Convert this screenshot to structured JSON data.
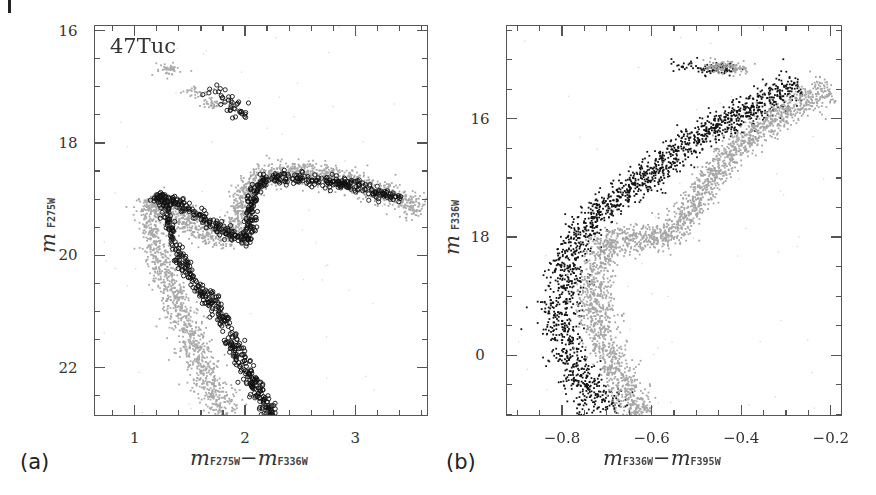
{
  "figure": {
    "panels": [
      {
        "letter": "(a)"
      },
      {
        "letter": "(b)"
      }
    ]
  },
  "chart_data": [
    {
      "type": "scatter",
      "panel": "(a)",
      "title": "",
      "annotation": "47Tuc",
      "xlabel": {
        "main": "m",
        "sub1": "F275W",
        "minus": "−",
        "main2": "m",
        "sub2": "F336W"
      },
      "ylabel": {
        "main": "m",
        "sub": "F275W"
      },
      "xlim": [
        0.63,
        3.66
      ],
      "ylim": [
        22.86,
        15.9
      ],
      "y_inverted": true,
      "xticks": [
        1,
        2,
        3
      ],
      "xtick_labels": [
        "1",
        "2",
        "3"
      ],
      "x_minor_step": 0.2,
      "yticks": [
        16,
        18,
        20,
        22
      ],
      "ytick_labels": [
        "16",
        "18",
        "20",
        "22"
      ],
      "y_minor_step": 0.5,
      "grid": false,
      "legend": null,
      "frame_px": {
        "left": 94,
        "top": 25,
        "right": 428,
        "bottom": 416
      },
      "series": [
        {
          "name": "first-generation (gray dots)",
          "marker": "filled-dot",
          "color": "#a8a8a8",
          "description": "Broad gray main sequence, subgiant branch and red-giant branch",
          "ridge": [
            [
              1.85,
              22.86
            ],
            [
              1.6,
              22.0
            ],
            [
              1.42,
              21.0
            ],
            [
              1.25,
              20.2
            ],
            [
              1.12,
              19.3
            ],
            [
              1.13,
              19.0
            ],
            [
              1.4,
              19.35
            ],
            [
              1.75,
              19.7
            ],
            [
              1.9,
              19.6
            ],
            [
              1.95,
              19.2
            ],
            [
              2.0,
              18.8
            ],
            [
              2.2,
              18.55
            ],
            [
              2.5,
              18.5
            ],
            [
              2.9,
              18.65
            ],
            [
              3.4,
              19.0
            ],
            [
              3.6,
              19.2
            ]
          ],
          "hb": [
            [
              1.3,
              16.7
            ],
            [
              1.55,
              17.1
            ],
            [
              1.7,
              17.3
            ]
          ],
          "count": 2600
        },
        {
          "name": "second-generation (black open circles)",
          "marker": "open-circle",
          "color": "#111111",
          "description": "Redder narrow sequence of open circles on MS, SGB, RGB",
          "ridge": [
            [
              2.25,
              22.86
            ],
            [
              2.0,
              22.0
            ],
            [
              1.78,
              21.0
            ],
            [
              1.5,
              20.4
            ],
            [
              1.35,
              19.8
            ],
            [
              1.28,
              19.2
            ],
            [
              1.2,
              18.9
            ],
            [
              1.5,
              19.2
            ],
            [
              1.8,
              19.55
            ],
            [
              2.0,
              19.75
            ],
            [
              2.05,
              19.5
            ],
            [
              2.05,
              19.0
            ],
            [
              2.15,
              18.7
            ],
            [
              2.3,
              18.6
            ],
            [
              2.6,
              18.65
            ],
            [
              3.0,
              18.75
            ],
            [
              3.4,
              19.0
            ]
          ],
          "hb": [
            [
              1.75,
              17.1
            ],
            [
              1.85,
              17.3
            ],
            [
              1.95,
              17.45
            ]
          ],
          "count": 900
        }
      ]
    },
    {
      "type": "scatter",
      "panel": "(b)",
      "title": "",
      "xlabel": {
        "main": "m",
        "sub1": "F336W",
        "minus": "−",
        "main2": "m",
        "sub2": "F395W"
      },
      "ylabel": {
        "main": "m",
        "sub": "F336W"
      },
      "xlim": [
        -0.925,
        -0.175
      ],
      "ylim": [
        21.03,
        14.41
      ],
      "y_inverted": true,
      "xticks": [
        -0.8,
        -0.6,
        -0.4,
        -0.2
      ],
      "xtick_labels": [
        "−0.8",
        "−0.6",
        "−0.4",
        "−0.2"
      ],
      "x_minor_step": 0.05,
      "yticks": [
        16,
        18,
        20
      ],
      "ytick_labels": [
        "16",
        "18",
        "0"
      ],
      "y_minor_step": 0.5,
      "grid": false,
      "legend": null,
      "frame_px": {
        "left": 506,
        "top": 25,
        "right": 842,
        "bottom": 416
      },
      "series": [
        {
          "name": "black dots",
          "marker": "filled-dot",
          "color": "#111111",
          "description": "Bluer sequence: MS, turnoff clump near (-0.78,18), sparse RGB and HB clump",
          "ridge": [
            [
              -0.68,
              21.03
            ],
            [
              -0.75,
              20.5
            ],
            [
              -0.8,
              19.8
            ],
            [
              -0.8,
              19.0
            ],
            [
              -0.78,
              18.4
            ],
            [
              -0.77,
              18.0
            ],
            [
              -0.7,
              17.5
            ],
            [
              -0.6,
              16.9
            ],
            [
              -0.5,
              16.3
            ],
            [
              -0.38,
              15.85
            ],
            [
              -0.27,
              15.4
            ]
          ],
          "hb": [
            [
              -0.53,
              15.1
            ],
            [
              -0.47,
              15.15
            ],
            [
              -0.43,
              15.15
            ]
          ],
          "count": 1800
        },
        {
          "name": "gray dots",
          "marker": "filled-dot",
          "color": "#a5a5a5",
          "description": "Redder sequence: MS, turnoff, SGB toward -0.55, RGB",
          "ridge": [
            [
              -0.62,
              21.03
            ],
            [
              -0.68,
              20.3
            ],
            [
              -0.72,
              19.6
            ],
            [
              -0.73,
              19.0
            ],
            [
              -0.72,
              18.4
            ],
            [
              -0.7,
              18.05
            ],
            [
              -0.62,
              18.0
            ],
            [
              -0.56,
              18.0
            ],
            [
              -0.5,
              17.4
            ],
            [
              -0.45,
              16.8
            ],
            [
              -0.38,
              16.3
            ],
            [
              -0.28,
              15.8
            ],
            [
              -0.2,
              15.5
            ]
          ],
          "hb": [
            [
              -0.45,
              15.1
            ],
            [
              -0.41,
              15.15
            ]
          ],
          "count": 2400
        }
      ]
    }
  ]
}
